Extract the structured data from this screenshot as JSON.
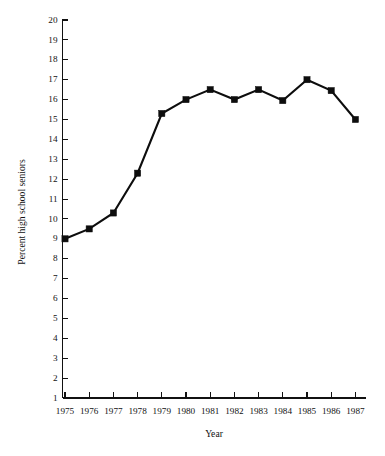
{
  "chart_data": {
    "type": "line",
    "title": "",
    "xlabel": "Year",
    "ylabel": "Percent high school seniors",
    "categories": [
      "1975",
      "1976",
      "1977",
      "1978",
      "1979",
      "1980",
      "1981",
      "1982",
      "1983",
      "1984",
      "1985",
      "1986",
      "1987"
    ],
    "x": [
      1975,
      1976,
      1977,
      1978,
      1979,
      1980,
      1981,
      1982,
      1983,
      1984,
      1985,
      1986,
      1987
    ],
    "values": [
      9.0,
      9.5,
      10.3,
      12.3,
      15.3,
      16.0,
      16.5,
      16.0,
      16.5,
      15.95,
      17.0,
      16.45,
      15.0
    ],
    "series": [
      {
        "name": "Percent high school seniors",
        "values": [
          9.0,
          9.5,
          10.3,
          12.3,
          15.3,
          16.0,
          16.5,
          16.0,
          16.5,
          15.95,
          17.0,
          16.45,
          15.0
        ]
      }
    ],
    "ylim": [
      0,
      20
    ],
    "xlim": [
      1974.5,
      1987.5
    ],
    "yticks": [
      1,
      2,
      3,
      4,
      5,
      6,
      7,
      8,
      9,
      10,
      11,
      12,
      13,
      14,
      15,
      16,
      17,
      18,
      19,
      20
    ],
    "ytick_labels": [
      "1",
      "2",
      "3",
      "4",
      "5",
      "6",
      "7",
      "8",
      "9",
      "10",
      "11",
      "12",
      "13",
      "14",
      "15",
      "16",
      "17",
      "18",
      "19",
      "20"
    ],
    "xtick_labels": [
      "1975",
      "1976",
      "1977",
      "1978",
      "1979",
      "1980",
      "1981",
      "1982",
      "1983",
      "1984",
      "1985",
      "1986",
      "1987"
    ],
    "grid": false,
    "legend": false,
    "legend_position": "none",
    "marker": "square",
    "line_color": "#0d0d0d",
    "marker_color": "#0d0d0d",
    "axis_color": "#111111",
    "background_color": "#ffffff"
  },
  "axes": {
    "x_title": "Year",
    "y_title": "Percent high school seniors"
  }
}
